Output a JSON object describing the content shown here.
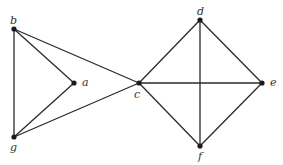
{
  "graph": {
    "nodes": [
      {
        "id": "a",
        "label": "a",
        "x": 74,
        "y": 83,
        "lx": 82,
        "ly": 77
      },
      {
        "id": "b",
        "label": "b",
        "x": 14,
        "y": 29,
        "lx": 10,
        "ly": 15
      },
      {
        "id": "c",
        "label": "c",
        "x": 139,
        "y": 83,
        "lx": 134,
        "ly": 89
      },
      {
        "id": "d",
        "label": "d",
        "x": 200,
        "y": 20,
        "lx": 197,
        "ly": 6
      },
      {
        "id": "e",
        "label": "e",
        "x": 262,
        "y": 83,
        "lx": 270,
        "ly": 77
      },
      {
        "id": "f",
        "label": "f",
        "x": 200,
        "y": 146,
        "lx": 198,
        "ly": 151
      },
      {
        "id": "g",
        "label": "g",
        "x": 14,
        "y": 137,
        "lx": 10,
        "ly": 142
      }
    ],
    "edges": [
      [
        "b",
        "g"
      ],
      [
        "b",
        "a"
      ],
      [
        "b",
        "c"
      ],
      [
        "a",
        "g"
      ],
      [
        "g",
        "c"
      ],
      [
        "c",
        "d"
      ],
      [
        "c",
        "e"
      ],
      [
        "c",
        "f"
      ],
      [
        "d",
        "e"
      ],
      [
        "d",
        "f"
      ],
      [
        "e",
        "f"
      ]
    ],
    "colors": {
      "edge": "#2a2a2a",
      "node": "#1a1a1a",
      "label": "#333333"
    }
  }
}
